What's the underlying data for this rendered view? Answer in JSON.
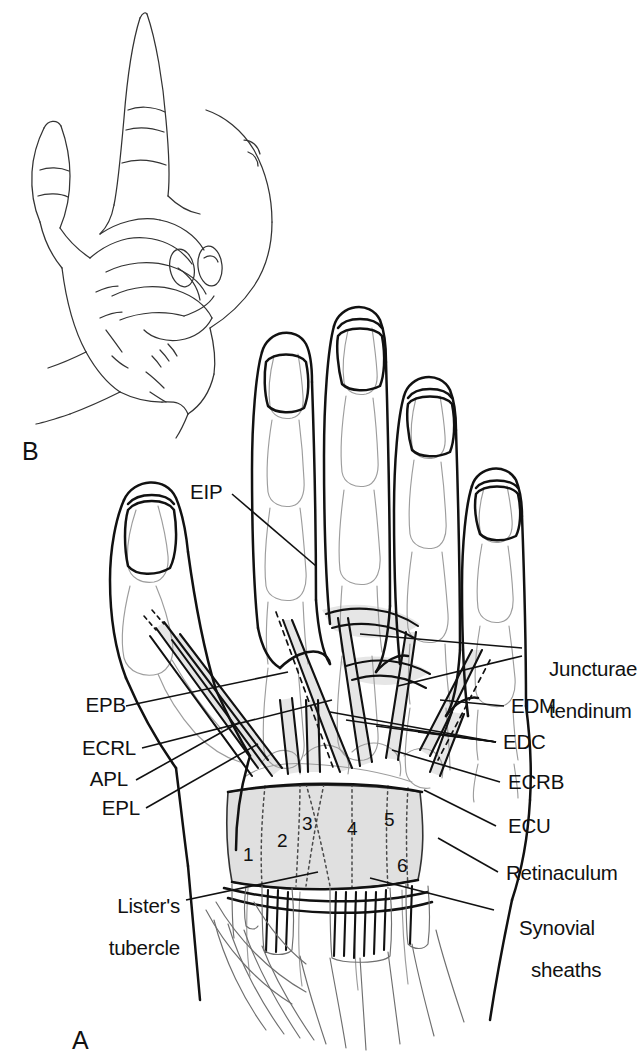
{
  "figure": {
    "panels": [
      {
        "id": "A",
        "letter": "A",
        "caption": "Dorsal view of hand and wrist showing extensor tendons, retinaculum and six dorsal compartments"
      },
      {
        "id": "B",
        "letter": "B",
        "caption": "Surface view of hand, thumb and index extended"
      }
    ]
  },
  "labels": {
    "eip": "EIP",
    "epb": "EPB",
    "ecrl": "ECRL",
    "apl": "APL",
    "epl": "EPL",
    "listers_line1": "Lister's",
    "listers_line2": "tubercle",
    "juncturae_line1": "Juncturae",
    "juncturae_line2": "tendinum",
    "edm": "EDM",
    "edc": "EDC",
    "ecrb": "ECRB",
    "ecu": "ECU",
    "retinaculum": "Retinaculum",
    "synovial_line1": "Synovial",
    "synovial_line2": "sheaths"
  },
  "compartments": [
    {
      "number": "1",
      "contents": "APL, EPB"
    },
    {
      "number": "2",
      "contents": "ECRL, ECRB"
    },
    {
      "number": "3",
      "contents": "EPL"
    },
    {
      "number": "4",
      "contents": "EDC, EIP"
    },
    {
      "number": "5",
      "contents": "EDM"
    },
    {
      "number": "6",
      "contents": "ECU"
    }
  ],
  "colors": {
    "ink": "#111111",
    "bone_line": "#9a9a9a",
    "tendon_fill": "#e8e8e8",
    "retinaculum_fill": "#e2e2e2",
    "compartment_fill": "#dcdcdc",
    "background": "#ffffff",
    "dotted_boundary": "#555555"
  }
}
